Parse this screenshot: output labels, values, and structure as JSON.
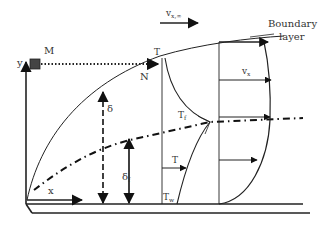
{
  "diagram": {
    "type": "boundary-layer-schematic",
    "labels": {
      "free_stream_velocity": "v",
      "free_stream_velocity_sub": "x,∞",
      "boundary_layer_line1": "Boundary",
      "boundary_layer_line2": "layer",
      "point_m": "M",
      "point_n": "N",
      "y_axis": "y",
      "x_axis": "x",
      "delta": "δ",
      "delta_f": "δ",
      "delta_f_sub": "f",
      "t_edge": "T",
      "t_edge_sub": "",
      "t_f": "T",
      "t_f_sub": "f",
      "t_local": "T",
      "t_wall": "T",
      "t_wall_sub": "w",
      "v_x": "v",
      "v_x_sub": "x"
    },
    "colors": {
      "stroke": "#222222",
      "marker_fill": "#444444",
      "text": "#333333",
      "background": "#ffffff"
    }
  }
}
